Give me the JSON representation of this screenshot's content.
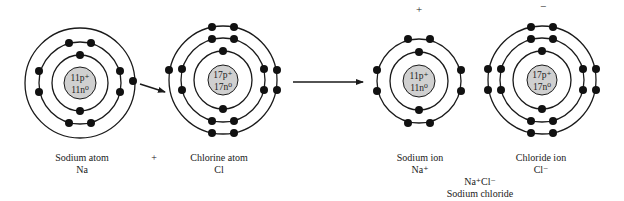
{
  "diagram": {
    "colors": {
      "line": "#1a1a1a",
      "electron": "#111111",
      "nucleus_fill": "#d0d0d0"
    },
    "species": [
      {
        "id": "sodium-atom",
        "name": "Sodium atom",
        "symbol": "Na",
        "nucleus": [
          "11p⁺",
          "11n⁰"
        ],
        "center": [
          80,
          83
        ],
        "shells": [
          {
            "r": 28,
            "electrons": 2
          },
          {
            "r": 41,
            "electrons": 8
          },
          {
            "r": 55,
            "electrons": 1
          }
        ]
      },
      {
        "id": "chlorine-atom",
        "name": "Chlorine atom",
        "symbol": "Cl",
        "nucleus": [
          "17p⁺",
          "17n⁰"
        ],
        "center": [
          223,
          80
        ],
        "shells": [
          {
            "r": 29,
            "electrons": 2
          },
          {
            "r": 42,
            "electrons": 8
          },
          {
            "r": 54,
            "electrons": 7
          }
        ]
      },
      {
        "id": "sodium-ion",
        "name": "Sodium ion",
        "symbol": "Na⁺",
        "charge": "+",
        "nucleus": [
          "11p⁺",
          "11n⁰"
        ],
        "center": [
          419,
          81
        ],
        "shells": [
          {
            "r": 29,
            "electrons": 2
          },
          {
            "r": 42,
            "electrons": 8
          }
        ]
      },
      {
        "id": "chloride-ion",
        "name": "Chloride ion",
        "symbol": "Cl⁻",
        "charge": "−",
        "nucleus": [
          "17p⁺",
          "17n⁰"
        ],
        "center": [
          542,
          80
        ],
        "shells": [
          {
            "r": 29,
            "electrons": 2
          },
          {
            "r": 42,
            "electrons": 8
          },
          {
            "r": 54,
            "electrons": 8
          }
        ]
      }
    ],
    "plus_sign": "+",
    "product": {
      "formula": "Na⁺Cl⁻",
      "name": "Sodium chloride"
    }
  }
}
